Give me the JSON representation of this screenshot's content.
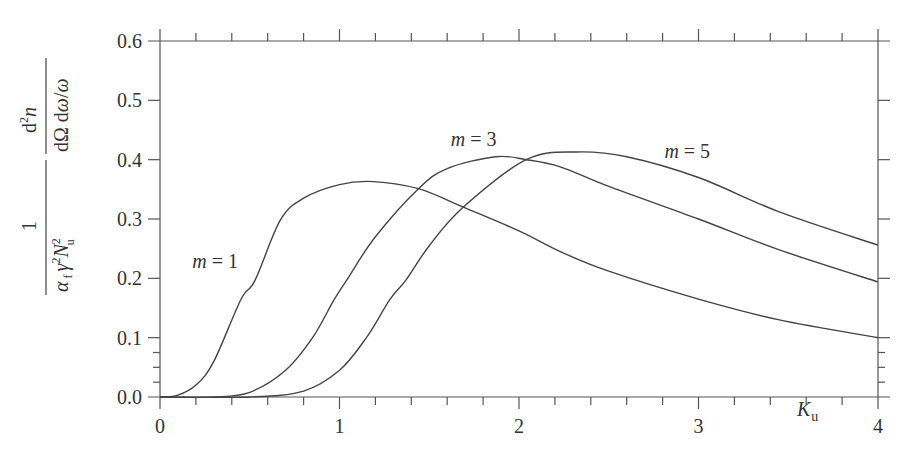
{
  "chart_data": {
    "type": "line",
    "title": "",
    "xlabel": "K_u",
    "ylabel": "1/(α_f γ² N_u²) · d²n/(dΩ dω/ω)",
    "xlim": [
      0,
      4
    ],
    "ylim": [
      0,
      0.6
    ],
    "grid": false,
    "legend": "inline labels",
    "x_ticks": [
      "0",
      "1",
      "2",
      "3",
      "4"
    ],
    "x_tick_values": [
      0,
      1,
      2,
      3,
      4
    ],
    "x_minor_step": 0.2,
    "y_ticks": [
      "0.0",
      "0.1",
      "0.2",
      "0.3",
      "0.4",
      "0.5",
      "0.6"
    ],
    "y_tick_values": [
      0,
      0.1,
      0.2,
      0.3,
      0.4,
      0.5,
      0.6
    ],
    "y_minor_ticks": [
      0.025,
      0.05,
      0.075
    ],
    "series": [
      {
        "name": "m = 1",
        "label_pos": {
          "x": 0.18,
          "y": 0.23
        },
        "points": [
          [
            0,
            0
          ],
          [
            0.1,
            0.003
          ],
          [
            0.2,
            0.02
          ],
          [
            0.3,
            0.06
          ],
          [
            0.45,
            0.164
          ],
          [
            0.53,
            0.197
          ],
          [
            0.67,
            0.298
          ],
          [
            0.8,
            0.335
          ],
          [
            1.0,
            0.358
          ],
          [
            1.19,
            0.363
          ],
          [
            1.44,
            0.351
          ],
          [
            1.69,
            0.32
          ],
          [
            2.0,
            0.28
          ],
          [
            2.23,
            0.245
          ],
          [
            2.5,
            0.212
          ],
          [
            3.0,
            0.165
          ],
          [
            3.45,
            0.13
          ],
          [
            4.0,
            0.1
          ]
        ]
      },
      {
        "name": "m = 3",
        "label_pos": {
          "x": 1.62,
          "y": 0.435
        },
        "points": [
          [
            0,
            0
          ],
          [
            0.3,
            0.0
          ],
          [
            0.5,
            0.008
          ],
          [
            0.7,
            0.045
          ],
          [
            0.85,
            0.1
          ],
          [
            0.97,
            0.164
          ],
          [
            1.04,
            0.197
          ],
          [
            1.2,
            0.27
          ],
          [
            1.44,
            0.351
          ],
          [
            1.6,
            0.385
          ],
          [
            1.87,
            0.405
          ],
          [
            2.04,
            0.4
          ],
          [
            2.23,
            0.388
          ],
          [
            2.5,
            0.355
          ],
          [
            3.0,
            0.3
          ],
          [
            3.45,
            0.248
          ],
          [
            4.0,
            0.194
          ]
        ]
      },
      {
        "name": "m = 5",
        "label_pos": {
          "x": 2.81,
          "y": 0.415
        },
        "points": [
          [
            0,
            0
          ],
          [
            0.5,
            0.0
          ],
          [
            0.8,
            0.01
          ],
          [
            1.0,
            0.045
          ],
          [
            1.15,
            0.1
          ],
          [
            1.28,
            0.164
          ],
          [
            1.37,
            0.197
          ],
          [
            1.5,
            0.255
          ],
          [
            1.69,
            0.32
          ],
          [
            2.04,
            0.4
          ],
          [
            2.32,
            0.413
          ],
          [
            2.6,
            0.405
          ],
          [
            3.0,
            0.37
          ],
          [
            3.45,
            0.312
          ],
          [
            4.0,
            0.256
          ]
        ]
      }
    ]
  },
  "labels": {
    "x_axis": {
      "main": "K",
      "sub": "u"
    },
    "y_axis": {
      "numerator_left": "1",
      "denominator_left": "α f γ² N²u",
      "numerator_right": "d²n",
      "denominator_right": "dΩ dω/ω"
    }
  }
}
